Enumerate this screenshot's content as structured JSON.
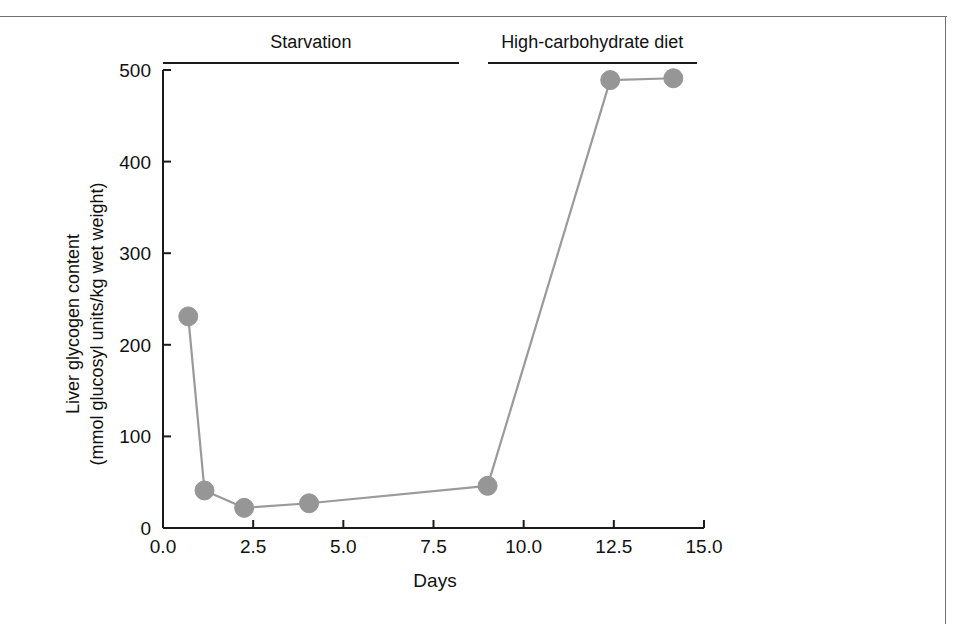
{
  "figure": {
    "y_axis_title_line1": "Liver glycogen content",
    "y_axis_title_line2": "(mmol glucosyl units/kg wet weight)",
    "x_axis_title": "Days",
    "condition_bars": [
      {
        "label": "Starvation",
        "x_start": 0.0,
        "x_end": 8.2
      },
      {
        "label": "High-carbohydrate diet",
        "x_start": 9.0,
        "x_end": 14.8
      }
    ]
  },
  "chart_data": {
    "type": "line",
    "title": "",
    "subtitle": "",
    "xlabel": "Days",
    "ylabel": "Liver glycogen content (mmol glucosyl units/kg wet weight)",
    "xlim": [
      0.0,
      15.0
    ],
    "ylim": [
      0,
      500
    ],
    "xticks": [
      0.0,
      2.5,
      5.0,
      7.5,
      10.0,
      12.5,
      15.0
    ],
    "xtick_labels": [
      "0.0",
      "2.5",
      "5.0",
      "7.5",
      "10.0",
      "12.5",
      "15.0"
    ],
    "yticks": [
      0,
      100,
      200,
      300,
      400,
      500
    ],
    "ytick_labels": [
      "0",
      "100",
      "200",
      "300",
      "400",
      "500"
    ],
    "grid": false,
    "legend": "none",
    "marker": "circle",
    "marker_color": "#969696",
    "line_color": "#9a9a9a",
    "series": [
      {
        "name": "Liver glycogen content",
        "x": [
          0.7,
          1.15,
          2.25,
          4.05,
          9.0,
          12.4,
          14.15
        ],
        "values": [
          231,
          41,
          22,
          27,
          46,
          489,
          491
        ]
      }
    ],
    "annotations": [
      {
        "text": "Starvation",
        "x_start": 0.0,
        "x_end": 8.2
      },
      {
        "text": "High-carbohydrate diet",
        "x_start": 9.0,
        "x_end": 14.8
      }
    ]
  }
}
